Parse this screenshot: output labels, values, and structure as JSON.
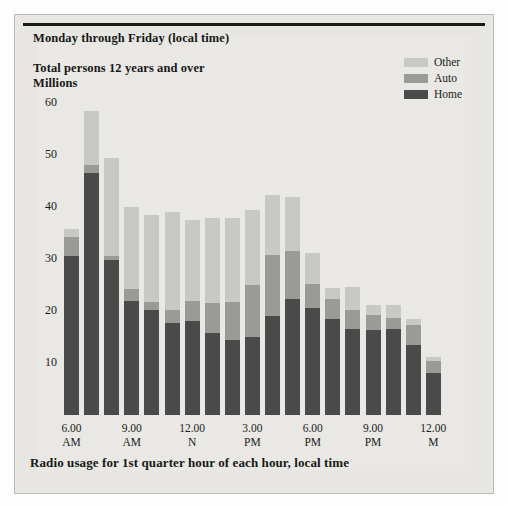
{
  "figure": {
    "title": "Monday through Friday (local time)",
    "subtitle_line1": "Total persons 12 years and over",
    "subtitle_line2": "Millions",
    "caption": "Radio usage for 1st quarter hour of each hour, local time"
  },
  "legend": {
    "position": "top-right",
    "items": [
      {
        "label": "Other",
        "color": "#c8c8c4"
      },
      {
        "label": "Auto",
        "color": "#9a9a96"
      },
      {
        "label": "Home",
        "color": "#4a4a4a"
      }
    ]
  },
  "axes": {
    "y_ticks": [
      "60",
      "50",
      "40",
      "30",
      "20",
      "10"
    ],
    "y_min": 0,
    "y_max": 62,
    "x_ticks": [
      {
        "line1": "6.00",
        "line2": "AM"
      },
      {
        "line1": "9.00",
        "line2": "AM"
      },
      {
        "line1": "12.00",
        "line2": "N"
      },
      {
        "line1": "3.00",
        "line2": "PM"
      },
      {
        "line1": "6.00",
        "line2": "PM"
      },
      {
        "line1": "9.00",
        "line2": "PM"
      },
      {
        "line1": "12.00",
        "line2": "M"
      }
    ]
  },
  "chart_data": {
    "type": "bar",
    "stacked": true,
    "title": "Monday through Friday (local time)",
    "subtitle": "Total persons 12 years and over / Millions",
    "xlabel": "Radio usage for 1st quarter hour of each hour, local time",
    "ylabel": "Millions",
    "ylim": [
      0,
      62
    ],
    "grid": false,
    "legend_position": "top-right",
    "categories": [
      "6.00 AM",
      "7.00 AM",
      "8.00 AM",
      "9.00 AM",
      "10.00 AM",
      "11.00 AM",
      "12.00 N",
      "1.00 PM",
      "2.00 PM",
      "3.00 PM",
      "4.00 PM",
      "5.00 PM",
      "6.00 PM",
      "7.00 PM",
      "8.00 PM",
      "9.00 PM",
      "10.00 PM",
      "11.00 PM",
      "12.00 M"
    ],
    "series": [
      {
        "name": "Home",
        "color": "#4a4a4a",
        "values": [
          30.5,
          46.5,
          29.8,
          22.0,
          20.2,
          17.6,
          18.0,
          15.8,
          14.5,
          15.0,
          19.0,
          22.4,
          20.6,
          18.4,
          16.6,
          16.4,
          16.6,
          13.4,
          8.0
        ]
      },
      {
        "name": "Auto",
        "color": "#9a9a96",
        "values": [
          3.8,
          1.5,
          0.8,
          2.2,
          1.6,
          2.6,
          4.0,
          5.8,
          7.3,
          10.0,
          11.8,
          9.2,
          4.6,
          4.0,
          3.6,
          2.8,
          2.0,
          4.0,
          2.4
        ]
      },
      {
        "name": "Other",
        "color": "#c8c8c4",
        "values": [
          1.5,
          10.5,
          18.8,
          15.8,
          16.6,
          18.8,
          15.6,
          16.2,
          16.0,
          14.4,
          11.6,
          10.4,
          6.0,
          2.0,
          4.4,
          2.0,
          2.6,
          1.0,
          0.8
        ]
      }
    ],
    "totals": [
      35.8,
      58.5,
      49.4,
      40.0,
      38.4,
      39.0,
      37.6,
      37.8,
      37.8,
      39.4,
      42.4,
      42.0,
      31.2,
      24.4,
      24.6,
      21.2,
      21.2,
      18.4,
      11.2
    ]
  }
}
